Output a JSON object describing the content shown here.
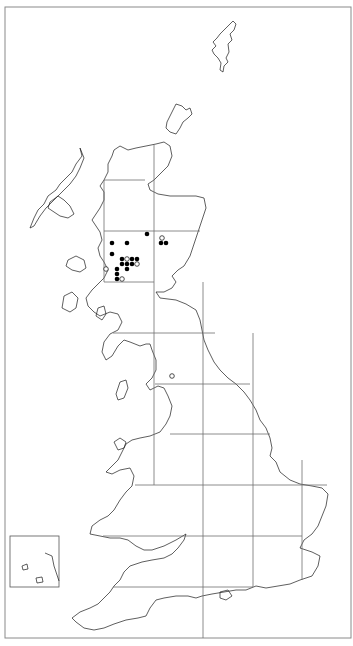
{
  "map": {
    "title": "",
    "width": 353,
    "height": 646,
    "frame": {
      "x": 5,
      "y": 7,
      "w": 346,
      "h": 631
    },
    "colors": {
      "background": "#ffffff",
      "coast": "#1a1a1a",
      "grid": "#6e6e6e",
      "filled_dot": "#000000",
      "open_dot_fill": "#ffffff"
    },
    "grid": {
      "vertical": [
        {
          "x": 104,
          "y1": 180,
          "y2": 282
        },
        {
          "x": 154,
          "y1": 145,
          "y2": 485
        },
        {
          "x": 203,
          "y1": 282,
          "y2": 638
        },
        {
          "x": 253,
          "y1": 333,
          "y2": 587
        },
        {
          "x": 302,
          "y1": 460,
          "y2": 580
        }
      ],
      "horizontal": [
        {
          "y": 180,
          "x1": 104,
          "x2": 145
        },
        {
          "y": 231,
          "x1": 104,
          "x2": 200
        },
        {
          "y": 282,
          "x1": 104,
          "x2": 154
        },
        {
          "y": 333,
          "x1": 113,
          "x2": 215
        },
        {
          "y": 384,
          "x1": 155,
          "x2": 250
        },
        {
          "y": 434,
          "x1": 170,
          "x2": 270
        },
        {
          "y": 485,
          "x1": 135,
          "x2": 327
        },
        {
          "y": 536,
          "x1": 103,
          "x2": 302
        },
        {
          "y": 587,
          "x1": 113,
          "x2": 253
        }
      ]
    },
    "inset": {
      "x": 10,
      "y": 536,
      "w": 49,
      "h": 51
    },
    "records": {
      "filled": [
        [
          147,
          234
        ],
        [
          161,
          243
        ],
        [
          166,
          243
        ],
        [
          112,
          243
        ],
        [
          127,
          243
        ],
        [
          112,
          254
        ],
        [
          122,
          259
        ],
        [
          132,
          259
        ],
        [
          137,
          259
        ],
        [
          122,
          264
        ],
        [
          127,
          264
        ],
        [
          132,
          264
        ],
        [
          117,
          269
        ],
        [
          127,
          269
        ],
        [
          117,
          274
        ],
        [
          117,
          279
        ]
      ],
      "open": [
        [
          162,
          238
        ],
        [
          127,
          259
        ],
        [
          137,
          264
        ],
        [
          106,
          269
        ],
        [
          122,
          279
        ],
        [
          172,
          376
        ]
      ]
    },
    "legend": {
      "filled_label": "",
      "open_label": ""
    }
  }
}
